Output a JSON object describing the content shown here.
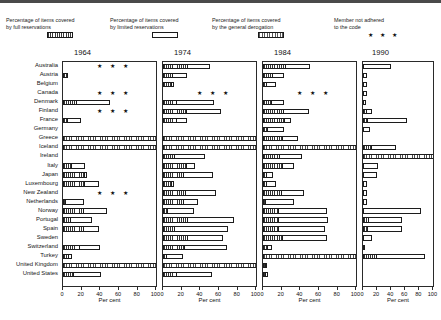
{
  "chart_data": {
    "type": "bar",
    "orientation": "horizontal",
    "title": "",
    "xlabel": "Per cent",
    "ylabel": "",
    "xlim": [
      0,
      100
    ],
    "xticks": [
      0,
      20,
      40,
      60,
      80,
      100
    ],
    "grid": false,
    "legend_position": "top",
    "categories": [
      "Australia",
      "Austria",
      "Belgium",
      "Canada",
      "Denmark",
      "Finland",
      "France",
      "Germany",
      "Greece",
      "Iceland",
      "Ireland",
      "Italy",
      "Japan",
      "Luxembourg",
      "New Zealand",
      "Netherlands",
      "Norway",
      "Portugal",
      "Spain",
      "Sweden",
      "Switzerland",
      "Turkey",
      "United Kingdom",
      "United States"
    ],
    "legend_entries": [
      {
        "label": "Percentage of items covered\nby full reservations",
        "swatch": "hatch-full",
        "year": "1964"
      },
      {
        "label": "Percentage of items covered\nby limited reservations",
        "swatch": "open",
        "year": "1974"
      },
      {
        "label": "Percentage of items covered\nby the general derogation",
        "swatch": "derog",
        "year": "1984"
      },
      {
        "label": "Member not adhered\nto the code",
        "swatch": "stars",
        "year": "1990"
      }
    ],
    "stars_glyph": "★ ★ ★",
    "panels": [
      {
        "year": "1964",
        "series": [
          {
            "name": "full reservations",
            "style": "hatch"
          },
          {
            "name": "limited reservations",
            "style": "open"
          },
          {
            "name": "general derogation",
            "style": "derog"
          }
        ],
        "rows": [
          {
            "country": "Australia",
            "not_adhered": true,
            "full": 0,
            "limited": 0,
            "derogation": 0
          },
          {
            "country": "Austria",
            "not_adhered": false,
            "full": 4,
            "limited": 5,
            "derogation": 0
          },
          {
            "country": "Belgium",
            "not_adhered": false,
            "full": 0,
            "limited": 0,
            "derogation": 0
          },
          {
            "country": "Canada",
            "not_adhered": true,
            "full": 0,
            "limited": 0,
            "derogation": 0
          },
          {
            "country": "Denmark",
            "not_adhered": false,
            "full": 14,
            "limited": 50,
            "derogation": 0
          },
          {
            "country": "Finland",
            "not_adhered": true,
            "full": 0,
            "limited": 0,
            "derogation": 0
          },
          {
            "country": "France",
            "not_adhered": false,
            "full": 4,
            "limited": 19,
            "derogation": 0
          },
          {
            "country": "Germany",
            "not_adhered": false,
            "full": 0,
            "limited": 0,
            "derogation": 0
          },
          {
            "country": "Greece",
            "not_adhered": false,
            "full": 0,
            "limited": 0,
            "derogation": 100
          },
          {
            "country": "Iceland",
            "not_adhered": false,
            "full": 0,
            "limited": 0,
            "derogation": 100
          },
          {
            "country": "Ireland",
            "not_adhered": false,
            "full": 0,
            "limited": 0,
            "derogation": 0
          },
          {
            "country": "Italy",
            "not_adhered": false,
            "full": 9,
            "limited": 24,
            "derogation": 0
          },
          {
            "country": "Japan",
            "not_adhered": false,
            "full": 23,
            "limited": 26,
            "derogation": 0
          },
          {
            "country": "Luxembourg",
            "not_adhered": false,
            "full": 23,
            "limited": 39,
            "derogation": 0
          },
          {
            "country": "New Zealand",
            "not_adhered": true,
            "full": 0,
            "limited": 0,
            "derogation": 0
          },
          {
            "country": "Netherlands",
            "not_adhered": false,
            "full": 2,
            "limited": 22,
            "derogation": 0
          },
          {
            "country": "Norway",
            "not_adhered": false,
            "full": 21,
            "limited": 47,
            "derogation": 0
          },
          {
            "country": "Portugal",
            "not_adhered": false,
            "full": 7,
            "limited": 31,
            "derogation": 0
          },
          {
            "country": "Spain",
            "not_adhered": false,
            "full": 21,
            "limited": 39,
            "derogation": 0
          },
          {
            "country": "Sweden",
            "not_adhered": false,
            "full": 0,
            "limited": 0,
            "derogation": 0
          },
          {
            "country": "Switzerland",
            "not_adhered": false,
            "full": 17,
            "limited": 40,
            "derogation": 0
          },
          {
            "country": "Turkey",
            "not_adhered": false,
            "full": 5,
            "limited": 10,
            "derogation": 0
          },
          {
            "country": "United Kingdom",
            "not_adhered": false,
            "full": 0,
            "limited": 0,
            "derogation": 100
          },
          {
            "country": "United States",
            "not_adhered": false,
            "full": 11,
            "limited": 41,
            "derogation": 0
          }
        ]
      },
      {
        "year": "1974",
        "series": [
          {
            "name": "full reservations",
            "style": "hatch"
          },
          {
            "name": "limited reservations",
            "style": "open"
          },
          {
            "name": "general derogation",
            "style": "derog"
          }
        ],
        "rows": [
          {
            "country": "Australia",
            "not_adhered": false,
            "full": 26,
            "limited": 50,
            "derogation": 0
          },
          {
            "country": "Austria",
            "not_adhered": false,
            "full": 10,
            "limited": 26,
            "derogation": 0
          },
          {
            "country": "Belgium",
            "not_adhered": false,
            "full": 9,
            "limited": 12,
            "derogation": 0
          },
          {
            "country": "Canada",
            "not_adhered": true,
            "full": 0,
            "limited": 0,
            "derogation": 0
          },
          {
            "country": "Denmark",
            "not_adhered": false,
            "full": 14,
            "limited": 55,
            "derogation": 0
          },
          {
            "country": "Finland",
            "not_adhered": false,
            "full": 25,
            "limited": 62,
            "derogation": 0
          },
          {
            "country": "France",
            "not_adhered": false,
            "full": 14,
            "limited": 26,
            "derogation": 0
          },
          {
            "country": "Germany",
            "not_adhered": false,
            "full": 0,
            "limited": 0,
            "derogation": 0
          },
          {
            "country": "Greece",
            "not_adhered": false,
            "full": 0,
            "limited": 0,
            "derogation": 100
          },
          {
            "country": "Iceland",
            "not_adhered": false,
            "full": 0,
            "limited": 0,
            "derogation": 100
          },
          {
            "country": "Ireland",
            "not_adhered": false,
            "full": 12,
            "limited": 45,
            "derogation": 0
          },
          {
            "country": "Italy",
            "not_adhered": false,
            "full": 25,
            "limited": 34,
            "derogation": 0
          },
          {
            "country": "Japan",
            "not_adhered": false,
            "full": 21,
            "limited": 53,
            "derogation": 0
          },
          {
            "country": "Luxembourg",
            "not_adhered": false,
            "full": 9,
            "limited": 12,
            "derogation": 0
          },
          {
            "country": "New Zealand",
            "not_adhered": false,
            "full": 24,
            "limited": 57,
            "derogation": 0
          },
          {
            "country": "Netherlands",
            "not_adhered": false,
            "full": 21,
            "limited": 37,
            "derogation": 0
          },
          {
            "country": "Norway",
            "not_adhered": false,
            "full": 4,
            "limited": 33,
            "derogation": 0
          },
          {
            "country": "Portugal",
            "not_adhered": false,
            "full": 26,
            "limited": 76,
            "derogation": 0
          },
          {
            "country": "Spain",
            "not_adhered": false,
            "full": 12,
            "limited": 70,
            "derogation": 0
          },
          {
            "country": "Sweden",
            "not_adhered": false,
            "full": 26,
            "limited": 64,
            "derogation": 0
          },
          {
            "country": "Switzerland",
            "not_adhered": false,
            "full": 23,
            "limited": 69,
            "derogation": 0
          },
          {
            "country": "Turkey",
            "not_adhered": false,
            "full": 3,
            "limited": 21,
            "derogation": 0
          },
          {
            "country": "United Kingdom",
            "not_adhered": false,
            "full": 0,
            "limited": 0,
            "derogation": 100
          },
          {
            "country": "United States",
            "not_adhered": false,
            "full": 14,
            "limited": 52,
            "derogation": 0
          }
        ]
      },
      {
        "year": "1984",
        "series": [
          {
            "name": "full reservations",
            "style": "hatch"
          },
          {
            "name": "limited reservations",
            "style": "open"
          },
          {
            "name": "general derogation",
            "style": "derog"
          }
        ],
        "rows": [
          {
            "country": "Australia",
            "not_adhered": false,
            "full": 24,
            "limited": 50,
            "derogation": 0
          },
          {
            "country": "Austria",
            "not_adhered": false,
            "full": 10,
            "limited": 22,
            "derogation": 0
          },
          {
            "country": "Belgium",
            "not_adhered": false,
            "full": 3,
            "limited": 14,
            "derogation": 0
          },
          {
            "country": "Canada",
            "not_adhered": true,
            "full": 0,
            "limited": 0,
            "derogation": 0
          },
          {
            "country": "Denmark",
            "not_adhered": false,
            "full": 9,
            "limited": 23,
            "derogation": 0
          },
          {
            "country": "Finland",
            "not_adhered": false,
            "full": 21,
            "limited": 49,
            "derogation": 0
          },
          {
            "country": "France",
            "not_adhered": false,
            "full": 22,
            "limited": 30,
            "derogation": 0
          },
          {
            "country": "Germany",
            "not_adhered": false,
            "full": 4,
            "limited": 22,
            "derogation": 0
          },
          {
            "country": "Greece",
            "not_adhered": false,
            "full": 20,
            "limited": 38,
            "derogation": 0
          },
          {
            "country": "Iceland",
            "not_adhered": false,
            "full": 0,
            "limited": 0,
            "derogation": 100
          },
          {
            "country": "Ireland",
            "not_adhered": false,
            "full": 17,
            "limited": 42,
            "derogation": 0
          },
          {
            "country": "Italy",
            "not_adhered": false,
            "full": 20,
            "limited": 33,
            "derogation": 0
          },
          {
            "country": "Japan",
            "not_adhered": false,
            "full": 3,
            "limited": 11,
            "derogation": 0
          },
          {
            "country": "Luxembourg",
            "not_adhered": false,
            "full": 3,
            "limited": 14,
            "derogation": 0
          },
          {
            "country": "New Zealand",
            "not_adhered": false,
            "full": 19,
            "limited": 44,
            "derogation": 0
          },
          {
            "country": "Netherlands",
            "not_adhered": false,
            "full": 2,
            "limited": 33,
            "derogation": 0
          },
          {
            "country": "Norway",
            "not_adhered": false,
            "full": 16,
            "limited": 68,
            "derogation": 0
          },
          {
            "country": "Portugal",
            "not_adhered": false,
            "full": 16,
            "limited": 70,
            "derogation": 0
          },
          {
            "country": "Spain",
            "not_adhered": false,
            "full": 16,
            "limited": 66,
            "derogation": 0
          },
          {
            "country": "Sweden",
            "not_adhered": false,
            "full": 20,
            "limited": 68,
            "derogation": 0
          },
          {
            "country": "Switzerland",
            "not_adhered": false,
            "full": 4,
            "limited": 10,
            "derogation": 0
          },
          {
            "country": "Turkey",
            "not_adhered": false,
            "full": 0,
            "limited": 0,
            "derogation": 100
          },
          {
            "country": "United Kingdom",
            "not_adhered": false,
            "full": 2,
            "limited": 4,
            "derogation": 0
          },
          {
            "country": "United States",
            "not_adhered": false,
            "full": 2,
            "limited": 5,
            "derogation": 0
          }
        ]
      },
      {
        "year": "1990",
        "series": [
          {
            "name": "full reservations",
            "style": "hatch"
          },
          {
            "name": "limited reservations",
            "style": "open"
          },
          {
            "name": "general derogation",
            "style": "derog"
          }
        ],
        "rows": [
          {
            "country": "Australia",
            "not_adhered": false,
            "full": 0,
            "limited": 40,
            "derogation": 0
          },
          {
            "country": "Austria",
            "not_adhered": false,
            "full": 0,
            "limited": 5,
            "derogation": 0
          },
          {
            "country": "Belgium",
            "not_adhered": false,
            "full": 0,
            "limited": 5,
            "derogation": 0
          },
          {
            "country": "Canada",
            "not_adhered": false,
            "full": 0,
            "limited": 5,
            "derogation": 0
          },
          {
            "country": "Denmark",
            "not_adhered": false,
            "full": 0,
            "limited": 4,
            "derogation": 0
          },
          {
            "country": "Finland",
            "not_adhered": false,
            "full": 4,
            "limited": 13,
            "derogation": 0
          },
          {
            "country": "France",
            "not_adhered": false,
            "full": 6,
            "limited": 63,
            "derogation": 0
          },
          {
            "country": "Germany",
            "not_adhered": false,
            "full": 0,
            "limited": 10,
            "derogation": 0
          },
          {
            "country": "Greece",
            "not_adhered": false,
            "full": 0,
            "limited": 0,
            "derogation": 0
          },
          {
            "country": "Iceland",
            "not_adhered": false,
            "full": 12,
            "limited": 47,
            "derogation": 0
          },
          {
            "country": "Ireland",
            "not_adhered": false,
            "full": 0,
            "limited": 0,
            "derogation": 100
          },
          {
            "country": "Italy",
            "not_adhered": false,
            "full": 0,
            "limited": 22,
            "derogation": 0
          },
          {
            "country": "Japan",
            "not_adhered": false,
            "full": 0,
            "limited": 20,
            "derogation": 0
          },
          {
            "country": "Luxembourg",
            "not_adhered": false,
            "full": 0,
            "limited": 5,
            "derogation": 0
          },
          {
            "country": "New Zealand",
            "not_adhered": false,
            "full": 0,
            "limited": 5,
            "derogation": 0
          },
          {
            "country": "Netherlands",
            "not_adhered": false,
            "full": 0,
            "limited": 5,
            "derogation": 0
          },
          {
            "country": "Norway",
            "not_adhered": false,
            "full": 0,
            "limited": 83,
            "derogation": 0
          },
          {
            "country": "Portugal",
            "not_adhered": false,
            "full": 7,
            "limited": 56,
            "derogation": 0
          },
          {
            "country": "Spain",
            "not_adhered": false,
            "full": 5,
            "limited": 55,
            "derogation": 0
          },
          {
            "country": "Sweden",
            "not_adhered": false,
            "full": 0,
            "limited": 13,
            "derogation": 0
          },
          {
            "country": "Switzerland",
            "not_adhered": false,
            "full": 0,
            "limited": 3,
            "derogation": 0
          },
          {
            "country": "Turkey",
            "not_adhered": false,
            "full": 18,
            "limited": 88,
            "derogation": 0
          },
          {
            "country": "United Kingdom",
            "not_adhered": false,
            "full": 0,
            "limited": 0,
            "derogation": 0
          },
          {
            "country": "United States",
            "not_adhered": false,
            "full": 0,
            "limited": 0,
            "derogation": 0
          }
        ]
      }
    ]
  }
}
